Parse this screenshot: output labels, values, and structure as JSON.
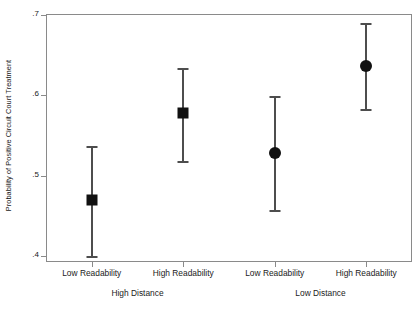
{
  "chart_data": {
    "type": "scatter",
    "title": "",
    "xlabel": "",
    "ylabel": "Probability of Positive Circuit Court Treatment",
    "ylim": [
      0.4,
      0.7
    ],
    "yticks": [
      0.4,
      0.5,
      0.6,
      0.7
    ],
    "ytick_labels": [
      ".4",
      ".5",
      ".6",
      ".7"
    ],
    "grid": false,
    "legend": "none",
    "categories": [
      "Low Readability",
      "High Readability",
      "Low Readability",
      "High Readability"
    ],
    "groups": [
      {
        "label": "High Distance",
        "categories": [
          "Low Readability",
          "High Readability"
        ]
      },
      {
        "label": "Low Distance",
        "categories": [
          "Low Readability",
          "High Readability"
        ]
      }
    ],
    "points": [
      {
        "category": "Low Readability",
        "group": "High Distance",
        "marker": "square",
        "value": 0.47,
        "ci_low": 0.399,
        "ci_high": 0.536
      },
      {
        "category": "High Readability",
        "group": "High Distance",
        "marker": "square",
        "value": 0.578,
        "ci_low": 0.517,
        "ci_high": 0.633
      },
      {
        "category": "Low Readability",
        "group": "Low Distance",
        "marker": "circle",
        "value": 0.528,
        "ci_low": 0.456,
        "ci_high": 0.598
      },
      {
        "category": "High Readability",
        "group": "Low Distance",
        "marker": "circle",
        "value": 0.636,
        "ci_low": 0.582,
        "ci_high": 0.689
      }
    ],
    "colors": {
      "marker": "#111111",
      "errorbar": "#4d4d4d",
      "axis": "#8a8a8a",
      "text": "#1a1a1a",
      "background": "#ffffff"
    }
  }
}
